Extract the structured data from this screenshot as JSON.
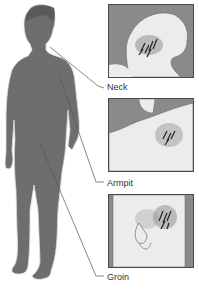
{
  "diagram": {
    "labels": [
      {
        "id": "neck",
        "text": "Neck"
      },
      {
        "id": "armpit",
        "text": "Armpit"
      },
      {
        "id": "groin",
        "text": "Groin"
      }
    ]
  },
  "colors": {
    "figure": "#6e6e6e",
    "figure_outline": "#e8e8e8",
    "panel_bg": "#8a8a8a",
    "skin_light": "#ededed",
    "nodes": "#222222",
    "leader_line": "#555555"
  }
}
